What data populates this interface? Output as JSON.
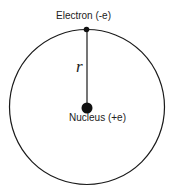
{
  "diagram": {
    "electron_label": "Electron (-e)",
    "nucleus_label": "Nucleus (+e)",
    "radius_label": "r",
    "colors": {
      "stroke": "#1a1a1a",
      "background": "#ffffff"
    }
  }
}
